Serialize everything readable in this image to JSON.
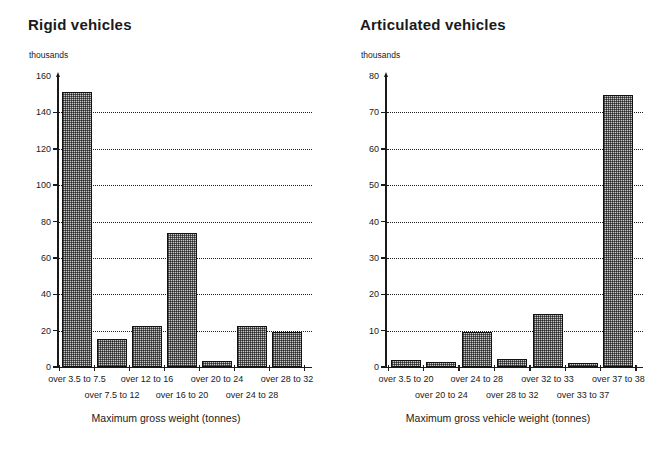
{
  "chart_data": [
    {
      "type": "bar",
      "title": "Rigid vehicles",
      "unit_note": "thousands",
      "xlabel": "Maximum gross weight (tonnes)",
      "ylabel": "thousands",
      "ylim": [
        0,
        160
      ],
      "yticks": [
        0,
        20,
        40,
        60,
        80,
        100,
        120,
        140,
        160
      ],
      "ytick_labels": [
        "0",
        "20",
        "40",
        "60",
        "80",
        "100",
        "120",
        "140",
        "160"
      ],
      "grid": "horizontal-dotted",
      "legend": "none",
      "categories": [
        "over 3.5 to 7.5",
        "over 7.5 to 12",
        "over 12 to 16",
        "over 16 to 20",
        "over 20 to 24",
        "over 24 to 28",
        "over 28 to 32"
      ],
      "values": [
        151,
        15.5,
        22.5,
        73.5,
        3.5,
        22.5,
        19
      ]
    },
    {
      "type": "bar",
      "title": "Articulated vehicles",
      "unit_note": "thousands",
      "xlabel": "Maximum gross vehicle weight (tonnes)",
      "ylabel": "thousands",
      "ylim": [
        0,
        80
      ],
      "yticks": [
        0,
        10,
        20,
        30,
        40,
        50,
        60,
        70,
        80
      ],
      "ytick_labels": [
        "0",
        "10",
        "20",
        "30",
        "40",
        "50",
        "60",
        "70",
        "80"
      ],
      "grid": "horizontal-dotted",
      "legend": "none",
      "categories": [
        "over 3.5 to 20",
        "over 20 to 24",
        "over 24 to 28",
        "over 28 to 32",
        "over 32 to 33",
        "over 33 to 37",
        "over 37 to 38"
      ],
      "values": [
        1.8,
        1.5,
        9.7,
        2.2,
        14.5,
        1.2,
        74.8
      ]
    }
  ]
}
